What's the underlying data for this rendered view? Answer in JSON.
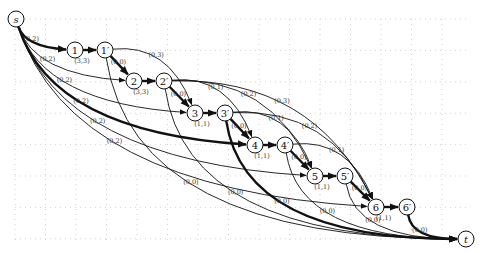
{
  "diagram": {
    "type": "flow-network",
    "nodes": [
      {
        "id": "s",
        "label": "s",
        "x": 16,
        "y": 19,
        "italic": true
      },
      {
        "id": "1",
        "label": "1",
        "x": 75,
        "y": 50
      },
      {
        "id": "1p",
        "label": "1′",
        "x": 105,
        "y": 50
      },
      {
        "id": "2",
        "label": "2",
        "x": 134,
        "y": 81
      },
      {
        "id": "2p",
        "label": "2′",
        "x": 164,
        "y": 81
      },
      {
        "id": "3",
        "label": "3",
        "x": 195,
        "y": 113
      },
      {
        "id": "3p",
        "label": "3′",
        "x": 225,
        "y": 113
      },
      {
        "id": "4",
        "label": "4",
        "x": 255,
        "y": 145
      },
      {
        "id": "4p",
        "label": "4′",
        "x": 285,
        "y": 145
      },
      {
        "id": "5",
        "label": "5",
        "x": 315,
        "y": 176
      },
      {
        "id": "5p",
        "label": "5′",
        "x": 345,
        "y": 176
      },
      {
        "id": "6",
        "label": "6",
        "x": 376,
        "y": 207
      },
      {
        "id": "6p",
        "label": "6′",
        "x": 407,
        "y": 207
      },
      {
        "id": "t",
        "label": "t",
        "x": 466,
        "y": 239,
        "italic": true
      }
    ],
    "edges": [
      {
        "from": "s",
        "to": "1",
        "label": "(0,2)",
        "thick": true
      },
      {
        "from": "s",
        "to": "2",
        "label": "(0,2)",
        "thick": false
      },
      {
        "from": "s",
        "to": "3",
        "label": "(0,2)",
        "thick": false
      },
      {
        "from": "s",
        "to": "4",
        "label": "(0,2)",
        "thick": true
      },
      {
        "from": "s",
        "to": "5",
        "label": "(0,2)",
        "thick": false
      },
      {
        "from": "s",
        "to": "6",
        "label": "(0,2)",
        "thick": false
      },
      {
        "from": "1",
        "to": "1p",
        "label": "(3,3)",
        "thick": true
      },
      {
        "from": "2",
        "to": "2p",
        "label": "(3,3)",
        "thick": true
      },
      {
        "from": "3",
        "to": "3p",
        "label": "(1,1)",
        "thick": true
      },
      {
        "from": "4",
        "to": "4p",
        "label": "(1,1)",
        "thick": true
      },
      {
        "from": "5",
        "to": "5p",
        "label": "(1,1)",
        "thick": true
      },
      {
        "from": "6",
        "to": "6p",
        "label": "(1,1)",
        "thick": true
      },
      {
        "from": "1p",
        "to": "2",
        "label": "(0,0)",
        "thick": true
      },
      {
        "from": "1p",
        "to": "3",
        "label": "(0,3)",
        "thick": false
      },
      {
        "from": "1p",
        "to": "t",
        "label": "(0,0)",
        "thick": false
      },
      {
        "from": "2p",
        "to": "3",
        "label": "(0,0)",
        "thick": true
      },
      {
        "from": "2p",
        "to": "4",
        "label": "(0,1)",
        "thick": false
      },
      {
        "from": "2p",
        "to": "5",
        "label": "(0,2)",
        "thick": false
      },
      {
        "from": "2p",
        "to": "6",
        "label": "(0,3)",
        "thick": false
      },
      {
        "from": "2p",
        "to": "t",
        "label": "(0,0)",
        "thick": false
      },
      {
        "from": "3p",
        "to": "4",
        "label": "(0,0)",
        "thick": true
      },
      {
        "from": "3p",
        "to": "5",
        "label": "(0,1)",
        "thick": false
      },
      {
        "from": "3p",
        "to": "6",
        "label": "(0,2)",
        "thick": false
      },
      {
        "from": "3p",
        "to": "t",
        "label": "(0,0)",
        "thick": true
      },
      {
        "from": "4p",
        "to": "5",
        "label": "(0,0)",
        "thick": true
      },
      {
        "from": "4p",
        "to": "6",
        "label": "(0,1)",
        "thick": false
      },
      {
        "from": "4p",
        "to": "t",
        "label": "(0,0)",
        "thick": false
      },
      {
        "from": "5p",
        "to": "6",
        "label": "(0,0)",
        "thick": true
      },
      {
        "from": "5p",
        "to": "t",
        "label": "(0,0)",
        "thick": false
      },
      {
        "from": "6p",
        "to": "t",
        "label": "(0,0)",
        "thick": true
      }
    ]
  }
}
